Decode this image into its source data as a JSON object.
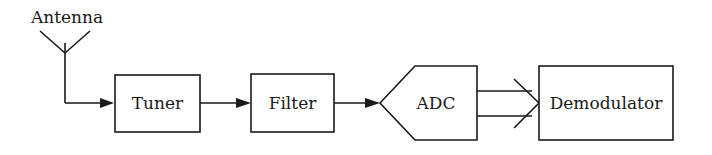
{
  "diagram": {
    "type": "block-diagram",
    "title": "",
    "nodes": [
      {
        "id": "antenna",
        "label": "Antenna",
        "shape": "antenna-symbol"
      },
      {
        "id": "tuner",
        "label": "Tuner",
        "shape": "rectangle"
      },
      {
        "id": "filter",
        "label": "Filter",
        "shape": "rectangle"
      },
      {
        "id": "adc",
        "label": "ADC",
        "shape": "pentagon-pointing-left"
      },
      {
        "id": "demodulator",
        "label": "Demodulator",
        "shape": "rectangle"
      }
    ],
    "edges": [
      {
        "from": "antenna",
        "to": "tuner",
        "style": "single-arrow"
      },
      {
        "from": "tuner",
        "to": "filter",
        "style": "single-arrow"
      },
      {
        "from": "filter",
        "to": "adc",
        "style": "single-arrow"
      },
      {
        "from": "adc",
        "to": "demodulator",
        "style": "double-line-bus-arrow"
      }
    ],
    "colors": {
      "line": "#1a1a1a",
      "background": "#ffffff"
    }
  }
}
